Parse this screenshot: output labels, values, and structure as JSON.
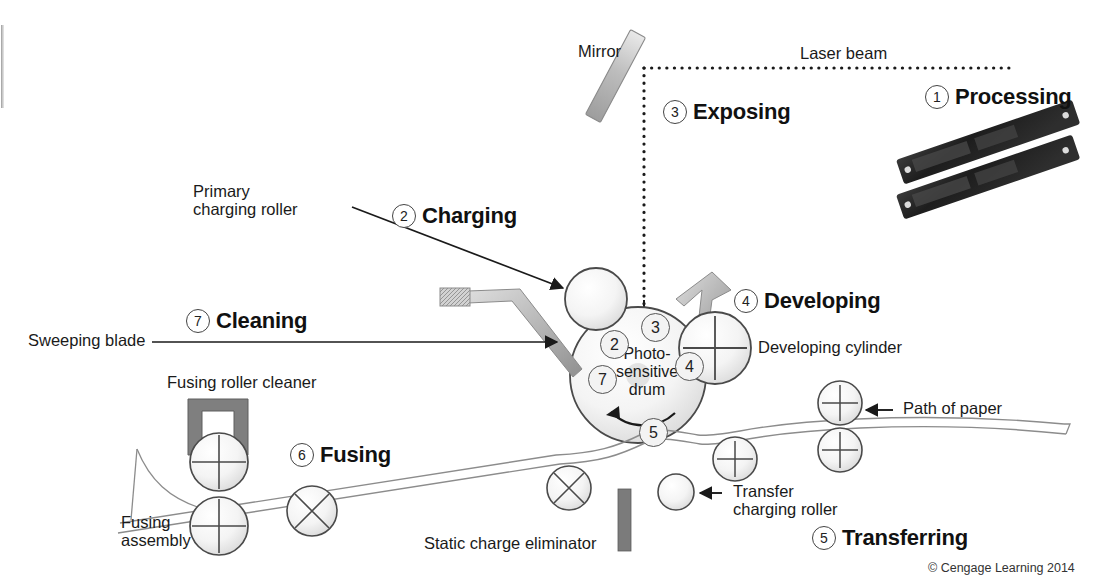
{
  "figure": {
    "copyright": "© Cengage Learning 2014"
  },
  "steps": [
    {
      "num": "1",
      "label": "Processing",
      "x": 925,
      "y": 84
    },
    {
      "num": "2",
      "label": "Charging",
      "x": 392,
      "y": 203
    },
    {
      "num": "3",
      "label": "Exposing",
      "x": 663,
      "y": 99
    },
    {
      "num": "4",
      "label": "Developing",
      "x": 734,
      "y": 288
    },
    {
      "num": "5",
      "label": "Transferring",
      "x": 812,
      "y": 525
    },
    {
      "num": "6",
      "label": "Fusing",
      "x": 290,
      "y": 442
    },
    {
      "num": "7",
      "label": "Cleaning",
      "x": 186,
      "y": 308
    }
  ],
  "drum_numbers": [
    {
      "num": "2",
      "x": 600,
      "y": 330
    },
    {
      "num": "3",
      "x": 641,
      "y": 313
    },
    {
      "num": "4",
      "x": 675,
      "y": 352
    },
    {
      "num": "5",
      "x": 639,
      "y": 418
    },
    {
      "num": "7",
      "x": 588,
      "y": 365
    }
  ],
  "labels": {
    "mirror": "Mirror",
    "laser_beam": "Laser beam",
    "primary_charging_roller": "Primary\ncharging roller",
    "sweeping_blade": "Sweeping blade",
    "photosensitive_drum": "Photo-\nsensitive\ndrum",
    "developing_cylinder": "Developing cylinder",
    "path_of_paper": "Path of paper",
    "transfer_charging_roller": "Transfer\ncharging roller",
    "static_charge_eliminator": "Static charge eliminator",
    "fusing_roller_cleaner": "Fusing roller cleaner",
    "fusing_assembly": "Fusing\nassembly"
  },
  "colors": {
    "ink": "#1a1a1a",
    "part_fill": "#f2f2f2",
    "part_stroke": "#4a4a4a",
    "gray_bar": "#8d8d8d",
    "dark_part": "#707070",
    "module_dark": "#2a2a2a"
  }
}
